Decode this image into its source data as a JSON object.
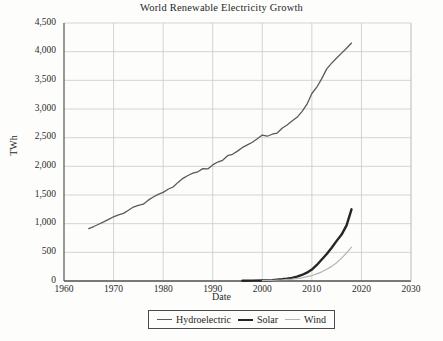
{
  "chart_data": {
    "type": "line",
    "title": "World Renewable Electricity Growth",
    "xlabel": "Date",
    "ylabel": "TWh",
    "xlim": [
      1960,
      2030
    ],
    "ylim": [
      0,
      4500
    ],
    "grid": true,
    "legend_position": "bottom",
    "xticks": [
      "1960",
      "1970",
      "1980",
      "1990",
      "2000",
      "2010",
      "2020",
      "2030"
    ],
    "yticks": [
      "0",
      "500",
      "1,000",
      "1,500",
      "2,000",
      "2,500",
      "3,000",
      "3,500",
      "4,000",
      "4,500"
    ],
    "series": [
      {
        "name": "Hydroelectric",
        "color": "#5a5a5a",
        "width": 1.3,
        "x": [
          1965,
          1966,
          1967,
          1968,
          1969,
          1970,
          1971,
          1972,
          1973,
          1974,
          1975,
          1976,
          1977,
          1978,
          1979,
          1980,
          1981,
          1982,
          1983,
          1984,
          1985,
          1986,
          1987,
          1988,
          1989,
          1990,
          1991,
          1992,
          1993,
          1994,
          1995,
          1996,
          1997,
          1998,
          1999,
          2000,
          2001,
          2002,
          2003,
          2004,
          2005,
          2006,
          2007,
          2008,
          2009,
          2010,
          2011,
          2012,
          2013,
          2014,
          2015,
          2016,
          2017,
          2018
        ],
        "values": [
          915,
          950,
          990,
          1030,
          1075,
          1120,
          1155,
          1180,
          1235,
          1290,
          1320,
          1340,
          1410,
          1465,
          1510,
          1545,
          1600,
          1640,
          1720,
          1790,
          1840,
          1880,
          1905,
          1960,
          1955,
          2025,
          2075,
          2105,
          2185,
          2210,
          2265,
          2330,
          2375,
          2420,
          2480,
          2545,
          2525,
          2560,
          2580,
          2665,
          2720,
          2790,
          2855,
          2955,
          3080,
          3270,
          3380,
          3530,
          3700,
          3800,
          3890,
          3975,
          4060,
          4150
        ]
      },
      {
        "name": "Solar",
        "color": "#262626",
        "width": 2.4,
        "x": [
          1996,
          1998,
          2000,
          2002,
          2004,
          2005,
          2006,
          2007,
          2008,
          2009,
          2010,
          2011,
          2012,
          2013,
          2014,
          2015,
          2016,
          2017,
          2018
        ],
        "values": [
          4,
          6,
          10,
          16,
          30,
          40,
          55,
          75,
          105,
          145,
          200,
          280,
          375,
          470,
          580,
          700,
          810,
          970,
          1250
        ]
      },
      {
        "name": "Wind",
        "color": "#b3b3b3",
        "width": 1.2,
        "x": [
          2000,
          2002,
          2004,
          2006,
          2008,
          2009,
          2010,
          2011,
          2012,
          2013,
          2014,
          2015,
          2016,
          2017,
          2018
        ],
        "values": [
          5,
          10,
          18,
          32,
          55,
          75,
          95,
          125,
          160,
          205,
          255,
          320,
          400,
          490,
          590
        ]
      }
    ]
  },
  "legend": {
    "items": [
      {
        "label": "Hydroelectric"
      },
      {
        "label": "Solar"
      },
      {
        "label": "Wind"
      }
    ]
  }
}
